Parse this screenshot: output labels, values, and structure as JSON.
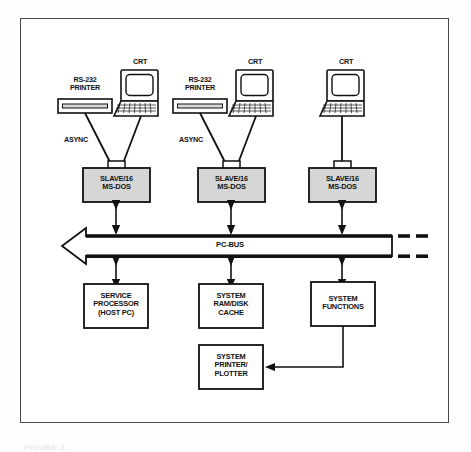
{
  "figure": {
    "type": "block-diagram",
    "background_color": "#fdfdfd",
    "frame_color": "#4a4a4a",
    "node_fill_gray": "#d6d6d6",
    "node_fill_white": "#ffffff",
    "line_color": "#111111"
  },
  "terminals": [
    {
      "id": "branch-1",
      "printer_label": "RS-232\nPRINTER",
      "crt_label": "CRT",
      "async_label": "ASYNC",
      "slave_label": "SLAVE/16\nMS-DOS"
    },
    {
      "id": "branch-2",
      "printer_label": "RS-232\nPRINTER",
      "crt_label": "CRT",
      "async_label": "ASYNC",
      "slave_label": "SLAVE/16\nMS-DOS"
    },
    {
      "id": "branch-3",
      "printer_label": "",
      "crt_label": "CRT",
      "async_label": "",
      "slave_label": "SLAVE/16\nMS-DOS"
    }
  ],
  "bus": {
    "label": "PC-BUS",
    "direction": "left",
    "continues_right": true
  },
  "modules": [
    {
      "id": "service-processor",
      "label": "SERVICE\nPROCESSOR\n(HOST PC)"
    },
    {
      "id": "system-ram-disk-cache",
      "label": "SYSTEM\nRAM/DISK\nCACHE"
    },
    {
      "id": "system-functions",
      "label": "SYSTEM\nFUNCTIONS"
    },
    {
      "id": "system-printer-plotter",
      "label": "SYSTEM\nPRINTER/\nPLOTTER"
    }
  ],
  "caption": "FIGURE 2."
}
